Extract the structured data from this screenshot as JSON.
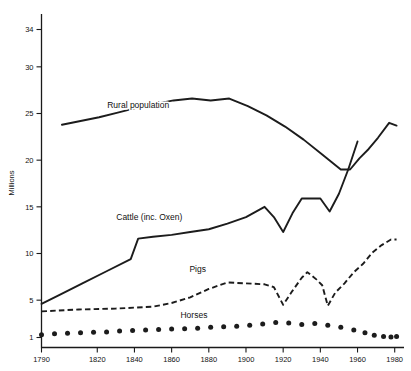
{
  "chart_data": {
    "type": "line",
    "title": "",
    "xlabel": "",
    "ylabel": "Millions",
    "xlim": [
      1790,
      1985
    ],
    "ylim": [
      0,
      35.5
    ],
    "grid": false,
    "legend": "inline-labels",
    "x_ticks": [
      1790,
      1820,
      1840,
      1860,
      1880,
      1900,
      1920,
      1940,
      1960,
      1980
    ],
    "x_tick_labels": [
      "1790",
      "1820",
      "1840",
      "1860",
      "1880",
      "1900",
      "1920",
      "1940",
      "1960",
      "1980"
    ],
    "y_ticks": [
      1,
      5,
      10,
      15,
      20,
      25,
      30,
      34
    ],
    "y_tick_labels": [
      "1",
      "5",
      "10",
      "15",
      "20",
      "25",
      "30",
      "34"
    ],
    "series": [
      {
        "name": "Rural population",
        "style": "solid",
        "label": "Rural population",
        "label_x": 1842,
        "label_y": 25.6,
        "x": [
          1801,
          1811,
          1821,
          1831,
          1841,
          1851,
          1861,
          1871,
          1881,
          1891,
          1901,
          1911,
          1921,
          1931,
          1941,
          1946,
          1951,
          1956,
          1961,
          1966,
          1971,
          1977,
          1981
        ],
        "y": [
          23.8,
          24.2,
          24.6,
          25.1,
          25.6,
          26.0,
          26.4,
          26.6,
          26.4,
          26.6,
          25.8,
          24.8,
          23.6,
          22.2,
          20.6,
          19.8,
          19.0,
          19.0,
          20.2,
          21.2,
          22.4,
          24.0,
          23.7
        ]
      },
      {
        "name": "Cattle (inc. Oxen)",
        "style": "solid",
        "label": "Cattle (inc. Oxen)",
        "label_x": 1848,
        "label_y": 13.6,
        "x": [
          1790,
          1800,
          1812,
          1825,
          1838,
          1842,
          1850,
          1860,
          1870,
          1880,
          1890,
          1900,
          1910,
          1915,
          1920,
          1925,
          1930,
          1935,
          1940,
          1945,
          1950,
          1955,
          1960
        ],
        "y": [
          4.6,
          5.6,
          6.8,
          8.1,
          9.4,
          11.6,
          11.8,
          12.0,
          12.3,
          12.6,
          13.2,
          13.9,
          15.0,
          13.9,
          12.3,
          14.3,
          15.9,
          15.9,
          15.9,
          14.5,
          16.4,
          19.0,
          22.0
        ]
      },
      {
        "name": "Pigs",
        "style": "dashed",
        "label": "Pigs",
        "label_x": 1874,
        "label_y": 8.0,
        "x": [
          1790,
          1810,
          1830,
          1850,
          1860,
          1870,
          1880,
          1890,
          1900,
          1910,
          1915,
          1920,
          1925,
          1930,
          1933,
          1938,
          1941,
          1944,
          1948,
          1953,
          1958,
          1963,
          1968,
          1973,
          1978,
          1981
        ],
        "y": [
          3.8,
          4.0,
          4.1,
          4.3,
          4.7,
          5.3,
          6.2,
          6.9,
          6.8,
          6.7,
          6.4,
          4.5,
          6.0,
          7.4,
          8.0,
          7.2,
          6.6,
          4.4,
          5.8,
          6.8,
          8.0,
          8.9,
          10.1,
          10.9,
          11.5,
          11.5
        ]
      },
      {
        "name": "Horses",
        "style": "dotted",
        "label": "Horses",
        "label_x": 1872,
        "label_y": 3.1,
        "x": [
          1790,
          1797,
          1804,
          1811,
          1818,
          1825,
          1832,
          1839,
          1846,
          1853,
          1860,
          1867,
          1874,
          1881,
          1888,
          1895,
          1902,
          1909,
          1916,
          1923,
          1930,
          1937,
          1944,
          1951,
          1958,
          1964,
          1969,
          1974,
          1978,
          1981
        ],
        "y": [
          1.3,
          1.4,
          1.45,
          1.5,
          1.55,
          1.6,
          1.7,
          1.75,
          1.8,
          1.85,
          1.9,
          1.95,
          2.0,
          2.1,
          2.15,
          2.2,
          2.3,
          2.45,
          2.6,
          2.55,
          2.4,
          2.5,
          2.3,
          2.1,
          1.8,
          1.5,
          1.25,
          1.1,
          1.05,
          1.1
        ]
      }
    ]
  },
  "axis": {
    "y_title": "Millions"
  }
}
